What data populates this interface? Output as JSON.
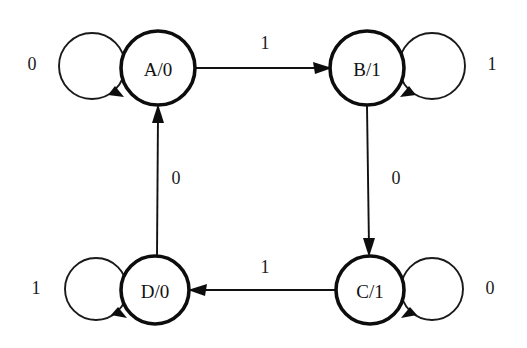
{
  "diagram": {
    "type": "state-transition-diagram",
    "background_color": "#ffffff",
    "stroke_color": "#111111",
    "node_radius": 36,
    "loop_radius": 33,
    "states": [
      {
        "id": "A",
        "label": "A/0",
        "state_name": "A",
        "output": "0",
        "cx": 158,
        "cy": 68,
        "r": 37
      },
      {
        "id": "B",
        "label": "B/1",
        "state_name": "B",
        "output": "1",
        "cx": 367,
        "cy": 68,
        "r": 37
      },
      {
        "id": "C",
        "label": "C/1",
        "state_name": "C",
        "output": "1",
        "cx": 370,
        "cy": 290,
        "r": 34
      },
      {
        "id": "D",
        "label": "D/0",
        "state_name": "D",
        "output": "0",
        "cx": 155,
        "cy": 290,
        "r": 34
      }
    ],
    "self_loops": [
      {
        "id": "loop-A",
        "state": "A",
        "input_label": "0",
        "side": "left",
        "cx": 92,
        "cy": 66,
        "r": 33,
        "label_x": 32,
        "label_y": 64
      },
      {
        "id": "loop-B",
        "state": "B",
        "input_label": "1",
        "side": "right",
        "cx": 432,
        "cy": 66,
        "r": 33,
        "label_x": 492,
        "label_y": 64
      },
      {
        "id": "loop-C",
        "state": "C",
        "input_label": "0",
        "side": "right",
        "cx": 432,
        "cy": 289,
        "r": 31,
        "label_x": 490,
        "label_y": 288
      },
      {
        "id": "loop-D",
        "state": "D",
        "input_label": "1",
        "side": "left",
        "cx": 96,
        "cy": 289,
        "r": 31,
        "label_x": 36,
        "label_y": 288
      }
    ],
    "transitions": [
      {
        "id": "A-to-B",
        "from": "A",
        "to": "B",
        "input_label": "1",
        "direction": "right",
        "x1": 196,
        "y1": 68,
        "x2": 328,
        "y2": 68,
        "label_x": 265,
        "label_y": 43
      },
      {
        "id": "B-to-C",
        "from": "B",
        "to": "C",
        "input_label": "0",
        "direction": "down",
        "x1": 367,
        "y1": 106,
        "x2": 369,
        "y2": 253,
        "label_x": 396,
        "label_y": 178
      },
      {
        "id": "C-to-D",
        "from": "C",
        "to": "D",
        "input_label": "1",
        "direction": "left",
        "x1": 335,
        "y1": 290,
        "x2": 192,
        "y2": 290,
        "label_x": 265,
        "label_y": 267
      },
      {
        "id": "D-to-A",
        "from": "D",
        "to": "A",
        "input_label": "0",
        "direction": "up",
        "x1": 157,
        "y1": 256,
        "x2": 158,
        "y2": 108,
        "label_x": 176,
        "label_y": 178
      }
    ]
  }
}
